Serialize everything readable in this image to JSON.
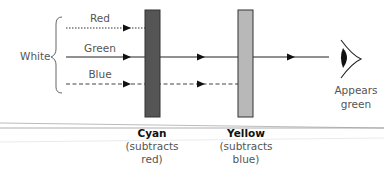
{
  "diagram": {
    "source_label": "White",
    "rays": [
      {
        "name": "Red",
        "style": "dotted",
        "y": 28,
        "x_end": 145
      },
      {
        "name": "Green",
        "style": "solid",
        "y": 57,
        "x_end": 329
      },
      {
        "name": "Blue",
        "style": "dashed",
        "y": 84,
        "x_end": 238
      }
    ],
    "filters": [
      {
        "name": "Cyan",
        "note_line1": "(subtracts",
        "note_line2": "red)",
        "color": "#555555",
        "x": 145
      },
      {
        "name": "Yellow",
        "note_line1": "(subtracts",
        "note_line2": "blue)",
        "color": "#b8b8b8",
        "x": 238
      }
    ],
    "observer": {
      "icon": "eye-icon",
      "result_line1": "Appears",
      "result_line2": "green"
    },
    "colors": {
      "line": "#222222",
      "text": "#555555",
      "label_bold": "#111111",
      "cyan_filter": "#555555",
      "yellow_filter": "#b8b8b8",
      "divider": "#888888"
    }
  }
}
